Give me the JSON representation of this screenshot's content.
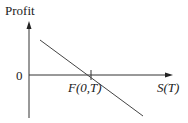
{
  "diagram": {
    "type": "payoff-diagram",
    "y_axis_label": "Profit",
    "x_axis_label": "S(T)",
    "origin_label": "0",
    "intercept_label": "F(0,T)",
    "line": {
      "description": "downward sloping profit line (short forward position)",
      "slope": "negative",
      "crosses_zero_at": "F(0,T)"
    },
    "colors": {
      "axis": "#333333",
      "line": "#444444",
      "text": "#222222",
      "background": "#ffffff"
    }
  }
}
